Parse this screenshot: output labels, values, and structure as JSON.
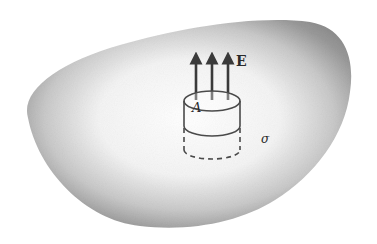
{
  "figure": {
    "labels": {
      "field": "E",
      "area": "A",
      "surface_charge": "σ"
    },
    "field_arrow_count": 3,
    "colors": {
      "background": "#ffffff",
      "conductor_shade": "#8c8c8c",
      "ink": "#3a3a3a"
    }
  }
}
